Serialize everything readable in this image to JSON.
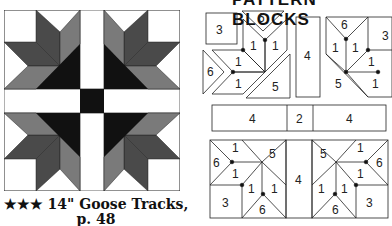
{
  "caption": {
    "line1": "★★★ 14\" Goose Tracks,",
    "line2": "p. 48"
  },
  "header": {
    "text": "PATTERN BLOCKS"
  },
  "colors": {
    "dark": "#111111",
    "mid_dark": "#4a4a4a",
    "mid": "#7a7a7a",
    "light": "#ffffff",
    "outline": "#222222"
  },
  "diagram_labels": {
    "top_left": [
      "3",
      "6",
      "1",
      "1",
      "1",
      "6",
      "1",
      "5"
    ],
    "top_middle": "4",
    "top_right": [
      "6",
      "3",
      "1",
      "1",
      "1",
      "6",
      "5",
      "1"
    ],
    "middle_strip": [
      "4",
      "2",
      "4"
    ],
    "bottom_left": [
      "1",
      "6",
      "5",
      "1",
      "1",
      "1",
      "3",
      "6"
    ],
    "bottom_middle": "4",
    "bottom_right": [
      "5",
      "1",
      "6",
      "1",
      "1",
      "1",
      "6",
      "3"
    ]
  }
}
